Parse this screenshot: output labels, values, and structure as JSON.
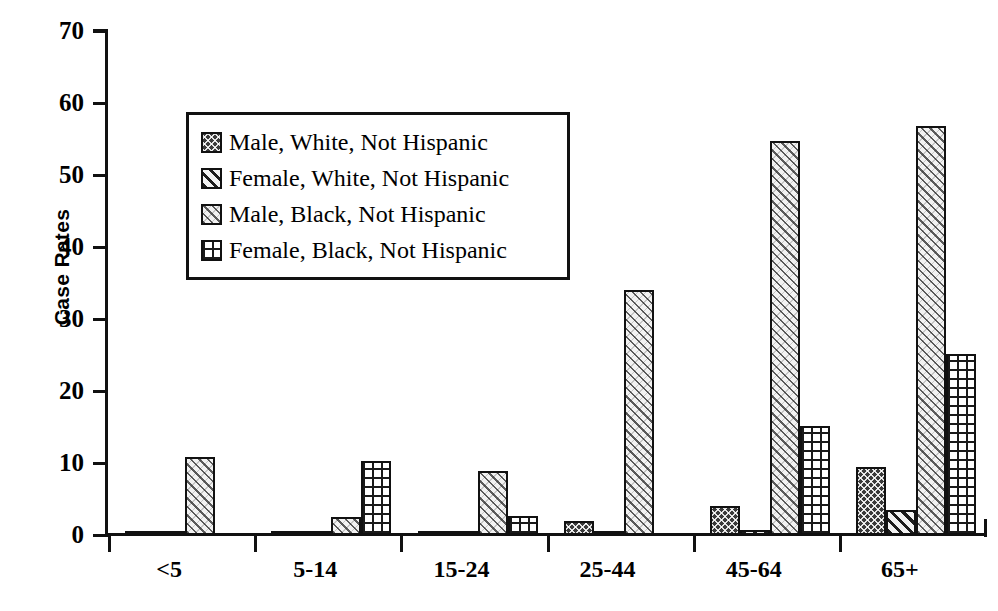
{
  "chart_data": {
    "type": "bar",
    "title": "",
    "subtitle": "",
    "xlabel": "",
    "ylabel": "Case Rates",
    "ylim": [
      0,
      70
    ],
    "ytick_step": 10,
    "yticks": [
      70,
      60,
      50,
      40,
      30,
      20,
      10,
      0
    ],
    "grid": false,
    "legend_position": "upper-left-inside",
    "categories": [
      "<5",
      "5-14",
      "15-24",
      "25-44",
      "45-64",
      "65+"
    ],
    "series": [
      {
        "name": "Male, White, Not Hispanic",
        "pattern": "dark-crosshatch",
        "values": [
          0.6,
          0.1,
          0.3,
          1.9,
          4.0,
          9.5
        ]
      },
      {
        "name": "Female, White, Not Hispanic",
        "pattern": "diagonal-stripes",
        "values": [
          0.6,
          0.1,
          0.1,
          0.4,
          0.7,
          3.5
        ]
      },
      {
        "name": "Male, Black, Not Hispanic",
        "pattern": "light-diagonal-hatch",
        "values": [
          10.8,
          2.5,
          8.9,
          34.0,
          54.7,
          56.8
        ]
      },
      {
        "name": "Female, Black, Not Hispanic",
        "pattern": "grid-dots",
        "values": [
          0,
          10.3,
          2.7,
          0,
          15.1,
          25.1
        ]
      }
    ]
  },
  "axis": {
    "y_title": "Case Rates",
    "y_tick_labels": [
      "70",
      "60",
      "50",
      "40",
      "30",
      "20",
      "10",
      "0"
    ],
    "x_tick_labels": [
      "<5",
      "5-14",
      "15-24",
      "25-44",
      "45-64",
      "65+"
    ]
  },
  "legend": {
    "items": [
      {
        "label": "Male, White, Not Hispanic"
      },
      {
        "label": "Female, White, Not Hispanic"
      },
      {
        "label": "Male, Black, Not Hispanic"
      },
      {
        "label": "Female, Black, Not Hispanic"
      }
    ]
  },
  "colors": {
    "axis": "#111111",
    "background": "#ffffff",
    "bar_outline": "#111111"
  }
}
